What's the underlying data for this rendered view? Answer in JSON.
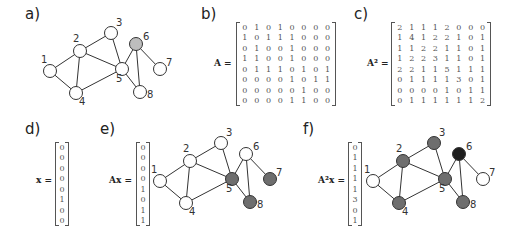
{
  "panels": {
    "a": {
      "label": "a)"
    },
    "b": {
      "label": "b)",
      "matrix_label": "A =",
      "matrix": [
        [
          0,
          1,
          0,
          1,
          0,
          0,
          0,
          0
        ],
        [
          1,
          0,
          1,
          1,
          1,
          0,
          0,
          0
        ],
        [
          0,
          1,
          0,
          0,
          1,
          0,
          0,
          0
        ],
        [
          1,
          1,
          0,
          0,
          1,
          0,
          0,
          0
        ],
        [
          0,
          1,
          1,
          1,
          0,
          1,
          0,
          1
        ],
        [
          0,
          0,
          0,
          0,
          1,
          0,
          1,
          1
        ],
        [
          0,
          0,
          0,
          0,
          0,
          1,
          0,
          0
        ],
        [
          0,
          0,
          0,
          0,
          1,
          1,
          0,
          0
        ]
      ]
    },
    "c": {
      "label": "c)",
      "matrix_label": "A² =",
      "matrix": [
        [
          2,
          1,
          1,
          1,
          2,
          0,
          0,
          0
        ],
        [
          1,
          4,
          1,
          2,
          2,
          1,
          0,
          1
        ],
        [
          1,
          1,
          2,
          2,
          1,
          1,
          0,
          1
        ],
        [
          1,
          2,
          2,
          3,
          1,
          1,
          0,
          1
        ],
        [
          2,
          2,
          1,
          1,
          5,
          1,
          1,
          1
        ],
        [
          0,
          1,
          1,
          1,
          1,
          3,
          0,
          1
        ],
        [
          0,
          0,
          0,
          0,
          1,
          0,
          1,
          1
        ],
        [
          0,
          1,
          1,
          1,
          1,
          1,
          1,
          2
        ]
      ]
    },
    "d": {
      "label": "d)",
      "vector_label": "x =",
      "vector": [
        0,
        0,
        0,
        0,
        0,
        1,
        0,
        0
      ]
    },
    "e": {
      "label": "e)",
      "vector_label": "Ax =",
      "vector": [
        0,
        0,
        0,
        0,
        1,
        0,
        1,
        1
      ]
    },
    "f": {
      "label": "f)",
      "vector_label": "A²x =",
      "vector": [
        0,
        1,
        1,
        1,
        1,
        3,
        0,
        1
      ]
    }
  },
  "graph": {
    "nodes": [
      "1",
      "2",
      "3",
      "4",
      "5",
      "6",
      "7",
      "8"
    ],
    "edges": [
      [
        1,
        2
      ],
      [
        1,
        4
      ],
      [
        2,
        3
      ],
      [
        2,
        4
      ],
      [
        2,
        5
      ],
      [
        3,
        5
      ],
      [
        4,
        5
      ],
      [
        5,
        6
      ],
      [
        5,
        8
      ],
      [
        6,
        7
      ],
      [
        6,
        8
      ]
    ]
  },
  "colors": {
    "white": "#ffffff",
    "light_gray": "#bdbdbd",
    "mid_gray": "#6e6e6e",
    "dark": "#1e1e1e",
    "edge": "#333333"
  }
}
